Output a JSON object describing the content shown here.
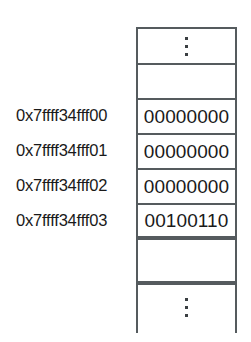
{
  "diagram": {
    "ellipsis_glyph": "vertical-ellipsis",
    "cells": [
      {
        "kind": "ellipsis",
        "address": "",
        "value": ""
      },
      {
        "kind": "empty",
        "address": "",
        "value": ""
      },
      {
        "kind": "byte",
        "address": "0x7ffff34fff00",
        "value": "00000000"
      },
      {
        "kind": "byte",
        "address": "0x7ffff34fff01",
        "value": "00000000"
      },
      {
        "kind": "byte",
        "address": "0x7ffff34fff02",
        "value": "00000000"
      },
      {
        "kind": "byte",
        "address": "0x7ffff34fff03",
        "value": "00100110"
      },
      {
        "kind": "empty",
        "address": "",
        "value": ""
      },
      {
        "kind": "ellipsis",
        "address": "",
        "value": ""
      }
    ],
    "addresses": [
      "0x7ffff34fff00",
      "0x7ffff34fff01",
      "0x7ffff34fff02",
      "0x7ffff34fff03"
    ],
    "values": [
      "00000000",
      "00000000",
      "00000000",
      "00100110"
    ],
    "colors": {
      "border": "#555b5e",
      "text": "#1a1a1a",
      "background": "#ffffff"
    }
  }
}
